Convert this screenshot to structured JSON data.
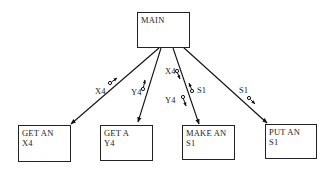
{
  "diagram": {
    "type": "structure-chart",
    "root": {
      "id": "main",
      "line1": "MAIN",
      "line2": ""
    },
    "modules": [
      {
        "id": "get-x4",
        "line1": "GET AN",
        "line2": "X4"
      },
      {
        "id": "get-y4",
        "line1": "GET A",
        "line2": "Y4"
      },
      {
        "id": "make-s1",
        "line1": "MAKE AN",
        "line2": "S1"
      },
      {
        "id": "put-s1",
        "line1": "PUT AN",
        "line2": "S1"
      }
    ],
    "couples": [
      {
        "edge": "main->get-x4",
        "label": "X4",
        "direction": "up"
      },
      {
        "edge": "main->get-y4",
        "label": "Y4",
        "direction": "up"
      },
      {
        "edge": "main->make-s1",
        "label": "X4",
        "direction": "down"
      },
      {
        "edge": "main->make-s1",
        "label": "S1",
        "direction": "up"
      },
      {
        "edge": "main->make-s1",
        "label": "Y4",
        "direction": "down"
      },
      {
        "edge": "main->put-s1",
        "label": "S1",
        "direction": "down"
      }
    ]
  }
}
